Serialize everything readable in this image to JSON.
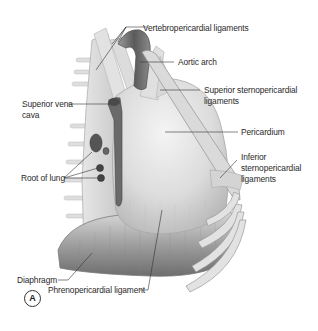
{
  "figure": {
    "panel_label": "A",
    "labels": {
      "vertebropericardial": "Vertebropericardial ligaments",
      "aortic_arch": "Aortic arch",
      "superior_sterno_1": "Superior sternopericardial",
      "superior_sterno_2": "ligaments",
      "svc_1": "Superior vena",
      "svc_2": "cava",
      "pericardium": "Pericardium",
      "inferior_sterno_1": "Inferior",
      "inferior_sterno_2": "sternopericardial",
      "inferior_sterno_3": "ligaments",
      "root_of_lung": "Root of lung",
      "diaphragm": "Diaphragm",
      "phrenopericardial": "Phrenopericardial ligament"
    },
    "colors": {
      "background": "#ffffff",
      "tissue_light": "#e4e4e4",
      "tissue_mid": "#bdbdbd",
      "tissue_dark": "#6a6a6a",
      "vessel": "#555555",
      "leader_line": "#333333",
      "text": "#2a2a2a"
    }
  }
}
